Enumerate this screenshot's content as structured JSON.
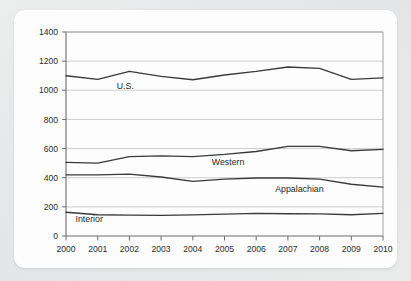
{
  "card": {
    "background_color": "#fdfdfd",
    "page_background_color": "#e9e9e9"
  },
  "chart_data": {
    "type": "line",
    "title": "",
    "subtitle": "",
    "xlabel": "",
    "ylabel": "",
    "x": [
      2000,
      2001,
      2002,
      2003,
      2004,
      2005,
      2006,
      2007,
      2008,
      2009,
      2010
    ],
    "xtick_labels": [
      "2000",
      "2001",
      "2002",
      "2003",
      "2004",
      "2005",
      "2006",
      "2007",
      "2008",
      "2009",
      "2010"
    ],
    "ytick_labels": [
      "0",
      "200",
      "400",
      "600",
      "800",
      "1000",
      "1200",
      "1400"
    ],
    "yticks": [
      0,
      200,
      400,
      600,
      800,
      1000,
      1200,
      1400
    ],
    "xlim": [
      2000,
      2010
    ],
    "ylim": [
      0,
      1400
    ],
    "grid": true,
    "legend_position": "inline-labels",
    "line_color": "#3a3a3a",
    "series": [
      {
        "name": "U.S.",
        "label": "U.S.",
        "label_x": 2001.6,
        "label_y": 1010,
        "values": [
          1100,
          1075,
          1130,
          1095,
          1072,
          1105,
          1130,
          1160,
          1150,
          1075,
          1085
        ]
      },
      {
        "name": "Western",
        "label": "Western",
        "label_x": 2004.6,
        "label_y": 490,
        "values": [
          505,
          500,
          545,
          550,
          545,
          560,
          580,
          615,
          615,
          585,
          595
        ]
      },
      {
        "name": "Appalachian",
        "label": "Appalachian",
        "label_x": 2006.6,
        "label_y": 305,
        "values": [
          420,
          420,
          425,
          405,
          375,
          390,
          398,
          398,
          390,
          355,
          335
        ]
      },
      {
        "name": "Interior",
        "label": "Interior",
        "label_x": 2000.3,
        "label_y": 95,
        "values": [
          163,
          146,
          143,
          142,
          145,
          150,
          155,
          153,
          152,
          146,
          155
        ]
      }
    ]
  }
}
